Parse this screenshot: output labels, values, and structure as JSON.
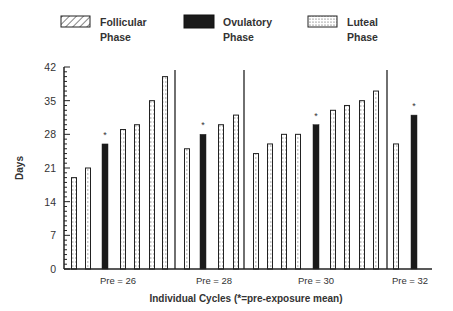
{
  "legend": [
    {
      "key": "follicular",
      "line1": "Follicular",
      "line2": "Phase",
      "pattern": "hatch"
    },
    {
      "key": "ovulatory",
      "line1": "Ovulatory",
      "line2": "Phase",
      "pattern": "solid"
    },
    {
      "key": "luteal",
      "line1": "Luteal",
      "line2": "Phase",
      "pattern": "dots"
    }
  ],
  "axes": {
    "ylabel": "Days",
    "xlabel": "Individual Cycles (*=pre-exposure mean)",
    "yticks": [
      "0",
      "7",
      "14",
      "21",
      "28",
      "35",
      "42"
    ]
  },
  "colors": {
    "ovulatory": "#1a1a1a",
    "outline": "#222222",
    "background": "#ffffff"
  },
  "chart_data": {
    "type": "bar",
    "title": "",
    "xlabel": "Individual Cycles (*=pre-exposure mean)",
    "ylabel": "Days",
    "ylim": [
      0,
      42
    ],
    "yticks": [
      0,
      7,
      14,
      21,
      28,
      35,
      42
    ],
    "minor_ticks_every": 1,
    "grid": false,
    "legend_position": "top",
    "groups": [
      {
        "label": "Pre = 26",
        "bars": [
          {
            "value": 19,
            "phase": "Luteal"
          },
          {
            "value": 21,
            "phase": "Luteal"
          },
          {
            "value": 26,
            "phase": "Ovulatory",
            "marker": "*"
          },
          {
            "value": 29,
            "phase": "Luteal"
          },
          {
            "value": 30,
            "phase": "Luteal"
          },
          {
            "value": 35,
            "phase": "Luteal"
          },
          {
            "value": 40,
            "phase": "Luteal"
          }
        ]
      },
      {
        "label": "Pre = 28",
        "bars": [
          {
            "value": 25,
            "phase": "Luteal"
          },
          {
            "value": 28,
            "phase": "Ovulatory",
            "marker": "*"
          },
          {
            "value": 30,
            "phase": "Luteal"
          },
          {
            "value": 32,
            "phase": "Luteal"
          }
        ]
      },
      {
        "label": "Pre = 30",
        "bars": [
          {
            "value": 24,
            "phase": "Luteal"
          },
          {
            "value": 26,
            "phase": "Luteal"
          },
          {
            "value": 28,
            "phase": "Luteal"
          },
          {
            "value": 28,
            "phase": "Luteal"
          },
          {
            "value": 30,
            "phase": "Ovulatory",
            "marker": "*"
          },
          {
            "value": 33,
            "phase": "Luteal"
          },
          {
            "value": 34,
            "phase": "Luteal"
          },
          {
            "value": 35,
            "phase": "Luteal"
          },
          {
            "value": 37,
            "phase": "Luteal"
          }
        ]
      },
      {
        "label": "Pre = 32",
        "bars": [
          {
            "value": 26,
            "phase": "Luteal"
          },
          {
            "value": 32,
            "phase": "Ovulatory",
            "marker": "*"
          }
        ]
      }
    ],
    "legend": [
      "Follicular Phase",
      "Ovulatory Phase",
      "Luteal Phase"
    ]
  },
  "layout_px": {
    "bar_centers": [
      [
        74,
        88,
        105,
        123,
        137,
        152,
        165
      ],
      [
        187,
        203,
        221,
        236
      ],
      [
        256,
        270,
        284,
        298,
        316,
        333,
        347,
        362,
        376
      ],
      [
        396,
        414
      ]
    ],
    "dividers": [
      175,
      244,
      387
    ],
    "group_label_x": [
      118,
      214,
      316,
      410
    ]
  }
}
